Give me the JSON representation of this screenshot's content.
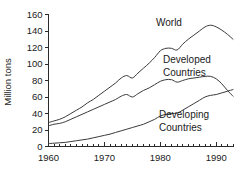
{
  "chart_data": {
    "type": "line",
    "title": "",
    "subtitle": "",
    "xlabel": "",
    "ylabel": "Million tons",
    "xlim": [
      1960,
      1993
    ],
    "ylim": [
      0,
      160
    ],
    "grid": false,
    "legend_position": "inline-annotations",
    "x_ticks_major": [
      1960,
      1970,
      1980,
      1990
    ],
    "x_tick_labels": [
      "1960",
      "1970",
      "1980",
      "1990"
    ],
    "x_minor_tick_step": 1,
    "y_ticks": [
      0,
      20,
      40,
      60,
      80,
      100,
      120,
      140,
      160
    ],
    "y_tick_labels": [
      "0",
      "20",
      "40",
      "60",
      "80",
      "100",
      "120",
      "140",
      "160"
    ],
    "x": [
      1960,
      1961,
      1962,
      1963,
      1964,
      1965,
      1966,
      1967,
      1968,
      1969,
      1970,
      1971,
      1972,
      1973,
      1974,
      1975,
      1976,
      1977,
      1978,
      1979,
      1980,
      1981,
      1982,
      1983,
      1984,
      1985,
      1986,
      1987,
      1988,
      1989,
      1990,
      1991,
      1992,
      1993
    ],
    "series": [
      {
        "name": "World",
        "label": "World",
        "color": "#3a3a3a",
        "values": [
          29,
          31,
          33,
          36,
          40,
          44,
          48,
          53,
          57,
          62,
          67,
          72,
          77,
          83,
          86,
          83,
          89,
          95,
          101,
          108,
          116,
          119,
          119,
          117,
          124,
          130,
          135,
          140,
          145,
          147,
          145,
          141,
          136,
          130
        ]
      },
      {
        "name": "Developed Countries",
        "label": "Developed Countries",
        "color": "#3a3a3a",
        "values": [
          25,
          27,
          28,
          30,
          33,
          36,
          39,
          42,
          45,
          48,
          51,
          54,
          57,
          61,
          63,
          60,
          64,
          68,
          71,
          75,
          79,
          81,
          81,
          78,
          80,
          82,
          83,
          84,
          85,
          85,
          82,
          76,
          68,
          61
        ]
      },
      {
        "name": "Developing Countries",
        "label": "Developing Countries",
        "color": "#3a3a3a",
        "values": [
          3.5,
          4,
          4.5,
          5,
          6,
          7,
          8,
          9,
          10.5,
          12,
          13.5,
          15,
          17,
          19,
          21,
          23,
          25,
          27,
          30,
          33,
          37,
          39,
          40,
          40.5,
          44,
          48,
          52,
          56,
          60,
          62,
          63,
          65,
          67,
          69
        ]
      }
    ],
    "annotations": [
      {
        "name": "world-annotation",
        "text": "World",
        "line1": "World",
        "line2": ""
      },
      {
        "name": "developed-annotation",
        "text": "Developed Countries",
        "line1": "Developed",
        "line2": "Countries"
      },
      {
        "name": "developing-annotation",
        "text": "Developing Countries",
        "line1": "Developing",
        "line2": "Countries"
      }
    ]
  }
}
